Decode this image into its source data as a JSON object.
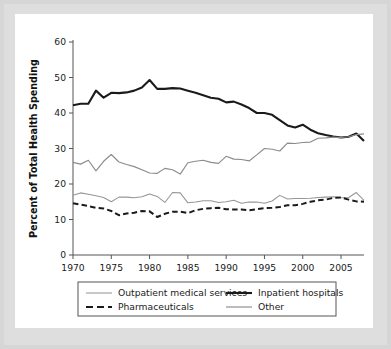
{
  "chart_data": {
    "type": "line",
    "title": "",
    "xlabel": "",
    "ylabel": "Percent of Total Health Spending",
    "xlim": [
      1970,
      2008
    ],
    "ylim": [
      0,
      60
    ],
    "ytick_labels": [
      "0",
      "10",
      "20",
      "30",
      "40",
      "50",
      "60"
    ],
    "yticks": [
      0,
      10,
      20,
      30,
      40,
      50,
      60
    ],
    "xtick_labels": [
      "1970",
      "1975",
      "1980",
      "1985",
      "1990",
      "1995",
      "2000",
      "2005"
    ],
    "xticks": [
      1970,
      1975,
      1980,
      1985,
      1990,
      1995,
      2000,
      2005
    ],
    "grid": false,
    "legend_position": "below-plot",
    "x": [
      1970,
      1971,
      1972,
      1973,
      1974,
      1975,
      1976,
      1977,
      1978,
      1979,
      1980,
      1981,
      1982,
      1983,
      1984,
      1985,
      1986,
      1987,
      1988,
      1989,
      1990,
      1991,
      1992,
      1993,
      1994,
      1995,
      1996,
      1997,
      1998,
      1999,
      2000,
      2001,
      2002,
      2003,
      2004,
      2005,
      2006,
      2007,
      2008
    ],
    "series": [
      {
        "name": "Inpatient hospitals",
        "style": "solid-thick-black",
        "color": "#1a1a1a",
        "values": [
          42.2,
          42.6,
          42.6,
          46.3,
          44.3,
          45.7,
          45.6,
          45.8,
          46.3,
          47.2,
          49.3,
          46.8,
          46.8,
          47.0,
          46.9,
          46.3,
          45.7,
          45.0,
          44.3,
          44.0,
          43.0,
          43.2,
          42.4,
          41.4,
          40.0,
          40.0,
          39.5,
          38.0,
          36.5,
          35.9,
          36.7,
          35.3,
          34.3,
          33.8,
          33.4,
          33.1,
          33.3,
          34.2,
          32.1
        ]
      },
      {
        "name": "Other",
        "style": "solid-medium-gray",
        "color": "#8c8c8c",
        "values": [
          26.1,
          25.6,
          26.7,
          23.7,
          26.4,
          28.3,
          26.2,
          25.5,
          24.9,
          24.0,
          23.1,
          23.0,
          24.4,
          24.0,
          22.8,
          26.0,
          26.4,
          26.7,
          26.1,
          25.8,
          27.8,
          27.0,
          26.9,
          26.5,
          28.2,
          30.0,
          29.8,
          29.3,
          31.5,
          31.4,
          31.7,
          31.8,
          32.9,
          33.0,
          33.2,
          33.1,
          33.3,
          33.9,
          34.1
        ]
      },
      {
        "name": "Outpatient medical services",
        "style": "solid-thin-gray",
        "color": "#969696",
        "values": [
          16.8,
          17.5,
          17.1,
          16.7,
          16.2,
          15.0,
          16.3,
          16.3,
          16.1,
          16.4,
          17.2,
          16.5,
          14.8,
          17.6,
          17.5,
          14.7,
          14.9,
          15.3,
          15.3,
          14.8,
          15.0,
          15.4,
          14.6,
          14.9,
          14.9,
          14.6,
          15.2,
          16.8,
          15.8,
          15.9,
          15.9,
          16.0,
          16.2,
          16.3,
          16.4,
          16.1,
          16.2,
          17.6,
          15.4
        ]
      },
      {
        "name": "Pharmaceuticals",
        "style": "dashed-black",
        "color": "#1a1a1a",
        "values": [
          14.6,
          14.2,
          13.8,
          13.3,
          13.1,
          12.4,
          11.2,
          11.7,
          11.9,
          12.4,
          12.3,
          10.7,
          11.6,
          12.2,
          12.2,
          11.8,
          12.6,
          13.0,
          13.2,
          13.3,
          12.9,
          12.8,
          12.8,
          12.6,
          12.9,
          13.2,
          13.3,
          13.5,
          14.0,
          14.0,
          14.4,
          15.0,
          15.4,
          15.6,
          16.1,
          16.2,
          15.6,
          15.1,
          15.0
        ]
      }
    ],
    "legend": [
      {
        "label": "Outpatient medical services",
        "style": "solid-thin-gray"
      },
      {
        "label": "Inpatient hospitals",
        "style": "solid-thick-black"
      },
      {
        "label": "Pharmaceuticals",
        "style": "dashed-black"
      },
      {
        "label": "Other",
        "style": "solid-medium-gray"
      }
    ]
  },
  "colors": {
    "mat": "#d6d6d6",
    "card": "#ffffff",
    "axis": "#555555",
    "black_series": "#1a1a1a",
    "gray_series": "#8c8c8c",
    "light_gray_series": "#969696"
  }
}
